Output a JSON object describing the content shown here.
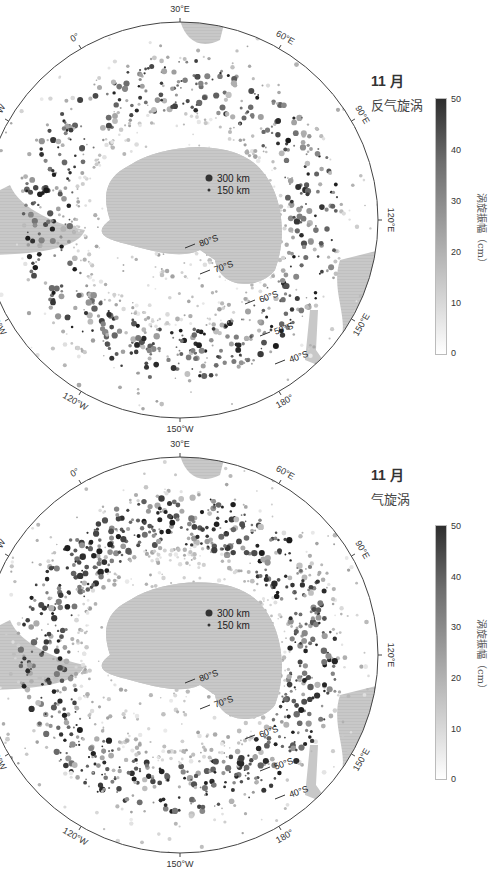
{
  "panels": [
    {
      "month": "11 月",
      "eddy_type": "反气旋涡",
      "colorbar": {
        "title": "涡旋振幅（cm）",
        "ticks": [
          "50",
          "40",
          "30",
          "20",
          "10",
          "0"
        ],
        "min": 0,
        "max": 50
      },
      "legend": {
        "large": "300 km",
        "small": "150 km"
      },
      "longitude_labels": [
        "30°E",
        "60°E",
        "90°E",
        "120°E",
        "150°E",
        "180°",
        "150°W",
        "120°W",
        "90°W",
        "60°W",
        "30°W",
        "0°"
      ],
      "latitude_labels": [
        "80°S",
        "70°S",
        "60°S",
        "50°S",
        "40°S"
      ]
    },
    {
      "month": "11 月",
      "eddy_type": "气旋涡",
      "colorbar": {
        "title": "涡旋振幅（cm）",
        "ticks": [
          "50",
          "40",
          "30",
          "20",
          "10",
          "0"
        ],
        "min": 0,
        "max": 50
      },
      "legend": {
        "large": "300 km",
        "small": "150 km"
      },
      "longitude_labels": [
        "30°E",
        "60°E",
        "90°E",
        "120°E",
        "150°E",
        "180°",
        "150°W",
        "120°W",
        "90°W",
        "60°W",
        "30°W",
        "0°"
      ],
      "latitude_labels": [
        "80°S",
        "70°S",
        "60°S",
        "50°S",
        "40°S"
      ]
    }
  ],
  "colors": {
    "land": "#c8c8c8",
    "outline": "#555555",
    "eddy_dark": "#333333",
    "eddy_light": "#d0d0d0"
  }
}
